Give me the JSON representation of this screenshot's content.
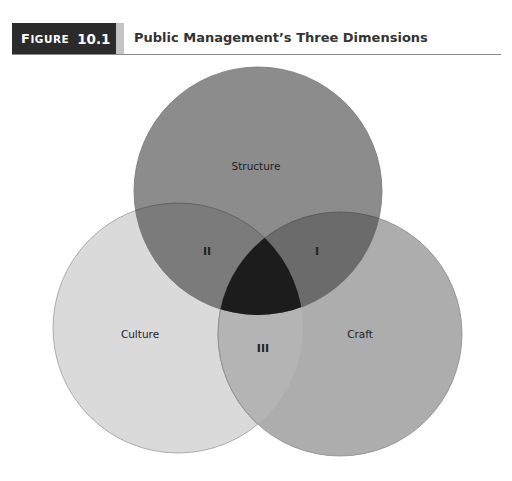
{
  "figure": {
    "label_word_first": "F",
    "label_word_rest": "IGURE",
    "label_number": "10.1",
    "title": "Public Management’s Three Dimensions"
  },
  "diagram": {
    "type": "venn",
    "circles": [
      {
        "id": "structure",
        "label": "Structure",
        "cx": 258,
        "cy": 191,
        "r": 124,
        "fill": "#8c8c8c"
      },
      {
        "id": "culture",
        "label": "Culture",
        "cx": 178,
        "cy": 328,
        "r": 125,
        "fill": "#dadada"
      },
      {
        "id": "craft",
        "label": "Craft",
        "cx": 340,
        "cy": 334,
        "r": 122,
        "fill": "#adadad"
      }
    ],
    "regions": [
      {
        "id": "I",
        "label": "I",
        "between": [
          "structure",
          "craft"
        ],
        "fill": "#6b6b6b"
      },
      {
        "id": "II",
        "label": "II",
        "between": [
          "structure",
          "culture"
        ],
        "fill": "#7b7b7b"
      },
      {
        "id": "III",
        "label": "III",
        "between": [
          "culture",
          "craft"
        ],
        "fill": "#b4b4b4"
      },
      {
        "id": "center",
        "label": "",
        "between": [
          "structure",
          "culture",
          "craft"
        ],
        "fill": "#1c1c1c"
      }
    ],
    "labels": {
      "structure": "Structure",
      "culture": "Culture",
      "craft": "Craft",
      "region_I": "I",
      "region_II": "II",
      "region_III": "III"
    }
  }
}
